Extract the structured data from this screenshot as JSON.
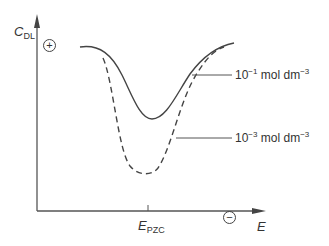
{
  "diagram": {
    "y_axis_label": "C",
    "y_axis_label_sub": "DL",
    "x_axis_label": "E",
    "x_tick_label": "E",
    "x_tick_label_sub": "PZC",
    "positive_sign": "+",
    "negative_sign": "−",
    "curves": [
      {
        "name": "10^-1 mol dm^-3",
        "style": "solid",
        "label_base": "10",
        "label_exp": "−1",
        "label_unit": " mol dm",
        "label_unit_exp": "−3"
      },
      {
        "name": "10^-3 mol dm^-3",
        "style": "dashed",
        "label_base": "10",
        "label_exp": "−3",
        "label_unit": " mol dm",
        "label_unit_exp": "−3"
      }
    ],
    "colors": {
      "line": "#444444",
      "background": "#ffffff"
    }
  }
}
